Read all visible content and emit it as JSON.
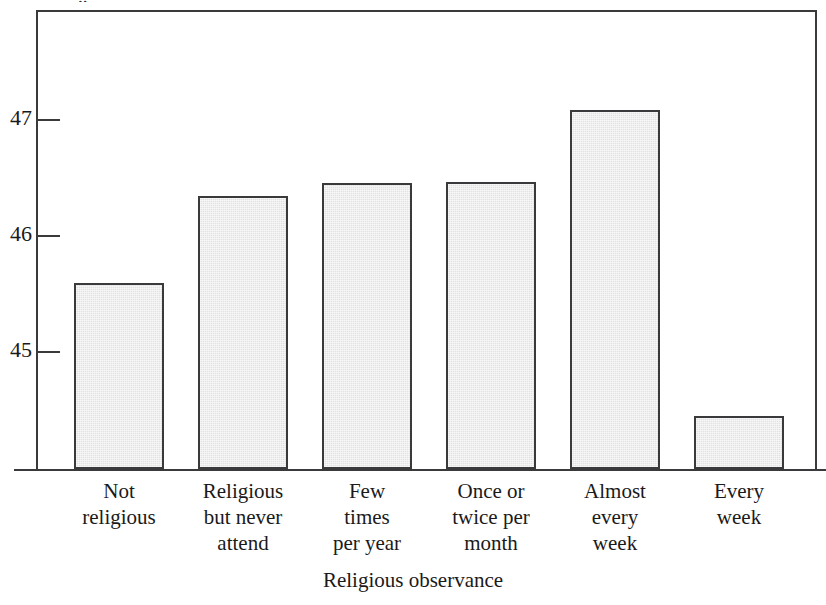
{
  "figure": {
    "width": 826,
    "height": 605,
    "background": "#ffffff",
    "clipped_title_fragment": "..",
    "frame_color": "#3a3a3c",
    "bar_fill": "#e2e2e2",
    "bar_edge": "#3a3a3c"
  },
  "chart_data": {
    "type": "bar",
    "title": "",
    "xlabel": "Religious observance",
    "ylabel": "",
    "categories": [
      "Not religious",
      "Religious but never attend",
      "Few times per year",
      "Once or twice per month",
      "Almost every week",
      "Every week"
    ],
    "category_lines": [
      [
        "Not",
        "religious"
      ],
      [
        "Religious",
        "but never",
        "attend"
      ],
      [
        "Few",
        "times",
        "per year"
      ],
      [
        "Once or",
        "twice per",
        "month"
      ],
      [
        "Almost",
        "every",
        "week"
      ],
      [
        "Every",
        "week"
      ]
    ],
    "values": [
      45.6,
      46.34,
      46.47,
      46.47,
      47.09,
      44.45
    ],
    "ytick_labels": [
      "47",
      "46",
      "45"
    ],
    "ytick_values": [
      47,
      46,
      45
    ],
    "ylim": [
      44.1,
      48.96
    ],
    "grid": false,
    "legend": null
  },
  "geometry": {
    "plot_left": 36,
    "plot_right": 817,
    "plot_top": 10,
    "baseline_y": 469,
    "ytick_pixels": [
      120,
      236,
      352
    ],
    "bars": [
      {
        "x": 74,
        "w": 90,
        "top": 283
      },
      {
        "x": 198,
        "w": 90,
        "top": 196
      },
      {
        "x": 322,
        "w": 90,
        "top": 183
      },
      {
        "x": 446,
        "w": 90,
        "top": 182
      },
      {
        "x": 570,
        "w": 90,
        "top": 110
      },
      {
        "x": 694,
        "w": 90,
        "top": 416
      }
    ],
    "label_centers": [
      119,
      243,
      367,
      491,
      615,
      739
    ]
  }
}
